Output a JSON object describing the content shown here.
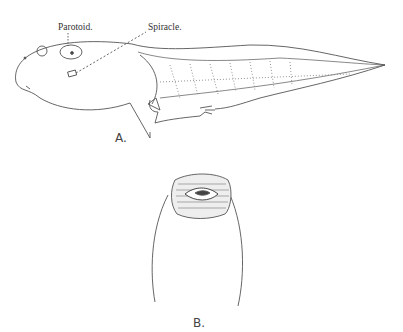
{
  "figure_a": {
    "label": "A.",
    "annotations": {
      "parotoid": "Parotoid.",
      "spiracle": "Spiracle."
    }
  },
  "figure_b": {
    "label": "B."
  },
  "colors": {
    "ink": "#444444",
    "background": "#ffffff"
  }
}
